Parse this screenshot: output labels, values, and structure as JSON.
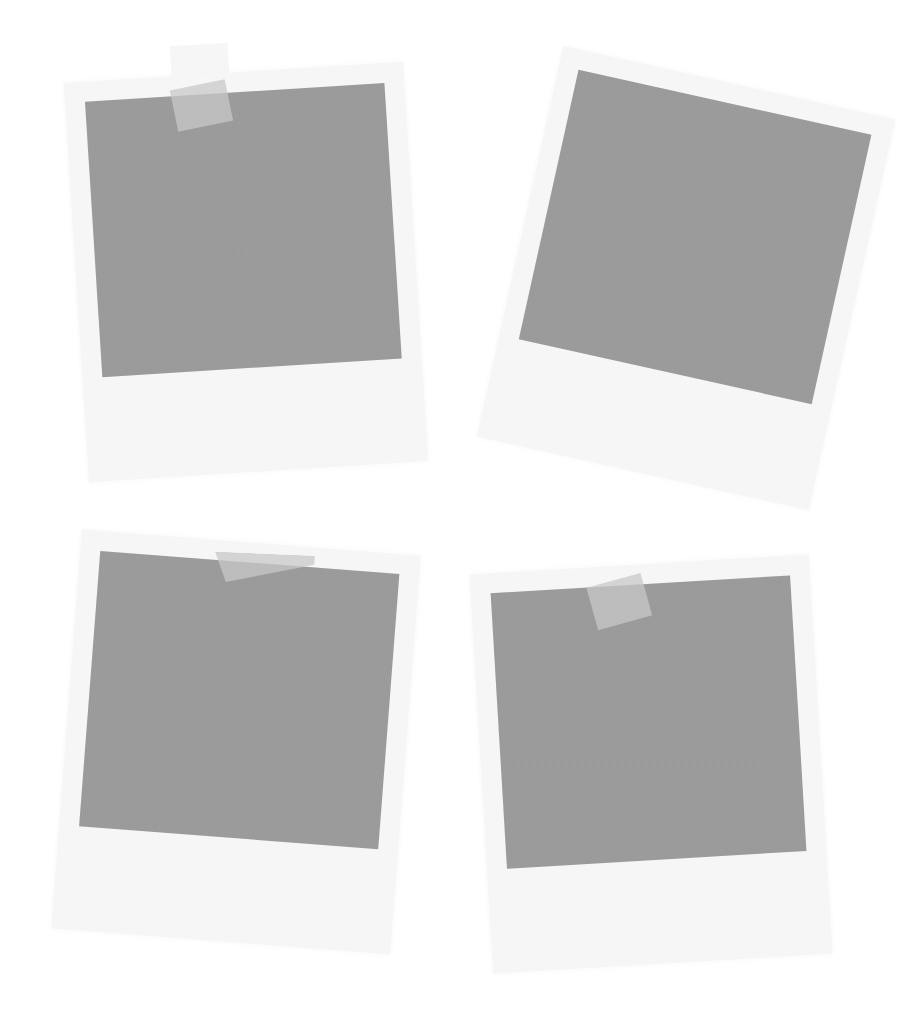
{
  "scene": {
    "description": "Four tilted blank polaroid photo frames with gray placeholders, three held by tape",
    "background_color": "#ffffff",
    "frame_color": "#f6f6f6",
    "photo_color": "#9b9b9b",
    "tape_color": "#c8c8c8"
  },
  "polaroids": [
    {
      "id": "top-left",
      "rotation_deg": -3.6,
      "has_tape": true
    },
    {
      "id": "top-right",
      "rotation_deg": 12.5,
      "has_tape": false
    },
    {
      "id": "bottom-left",
      "rotation_deg": 4.4,
      "has_tape": true
    },
    {
      "id": "bottom-right",
      "rotation_deg": -3.4,
      "has_tape": true
    }
  ]
}
